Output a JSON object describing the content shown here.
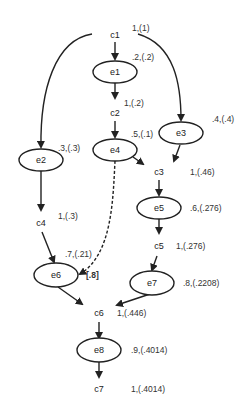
{
  "diagram": {
    "type": "event-tree",
    "nodes": {
      "c1": {
        "label": "c1",
        "value": "1,(1)"
      },
      "e1": {
        "label": "e1",
        "value": ".2,(.2)"
      },
      "c2": {
        "label": "c2",
        "value": "1,(.2)"
      },
      "e2": {
        "label": "e2",
        "value": ".3,(.3)"
      },
      "e3": {
        "label": "e3",
        "value": ".4,(.4)"
      },
      "e4": {
        "label": "e4",
        "value": ".5,(.1)"
      },
      "c3": {
        "label": "c3",
        "value": "1,(.46)"
      },
      "c4": {
        "label": "c4",
        "value": "1,(.3)"
      },
      "e5": {
        "label": "e5",
        "value": ".6,(.276)"
      },
      "c5": {
        "label": "c5",
        "value": "1,(.276)"
      },
      "e6": {
        "label": "e6",
        "value": ".7,(.21)",
        "extra": "[.8]"
      },
      "e7": {
        "label": "e7",
        "value": ".8,(.2208)"
      },
      "c6": {
        "label": "c6",
        "value": "1,(.446)"
      },
      "e8": {
        "label": "e8",
        "value": ".9,(.4014)"
      },
      "c7": {
        "label": "c7",
        "value": "1,(.4014)"
      }
    },
    "edges": [
      {
        "from": "c1",
        "to": "e1",
        "style": "solid"
      },
      {
        "from": "c1",
        "to": "e2",
        "style": "solid"
      },
      {
        "from": "c1",
        "to": "e3",
        "style": "solid"
      },
      {
        "from": "e1",
        "to": "c2",
        "style": "solid"
      },
      {
        "from": "c2",
        "to": "e4",
        "style": "solid"
      },
      {
        "from": "e4",
        "to": "c3",
        "style": "solid"
      },
      {
        "from": "e3",
        "to": "c3",
        "style": "solid"
      },
      {
        "from": "e2",
        "to": "c4",
        "style": "solid"
      },
      {
        "from": "c3",
        "to": "e5",
        "style": "solid"
      },
      {
        "from": "e5",
        "to": "c5",
        "style": "solid"
      },
      {
        "from": "c4",
        "to": "e6",
        "style": "solid"
      },
      {
        "from": "e4",
        "to": "e6",
        "style": "dashed",
        "weight": "[.8]"
      },
      {
        "from": "c5",
        "to": "e7",
        "style": "solid"
      },
      {
        "from": "e6",
        "to": "c6",
        "style": "solid"
      },
      {
        "from": "e7",
        "to": "c6",
        "style": "solid"
      },
      {
        "from": "c6",
        "to": "e8",
        "style": "solid"
      },
      {
        "from": "e8",
        "to": "c7",
        "style": "solid"
      }
    ],
    "colors": {
      "stroke": "#222222",
      "text": "#333333",
      "background": "#ffffff"
    }
  }
}
